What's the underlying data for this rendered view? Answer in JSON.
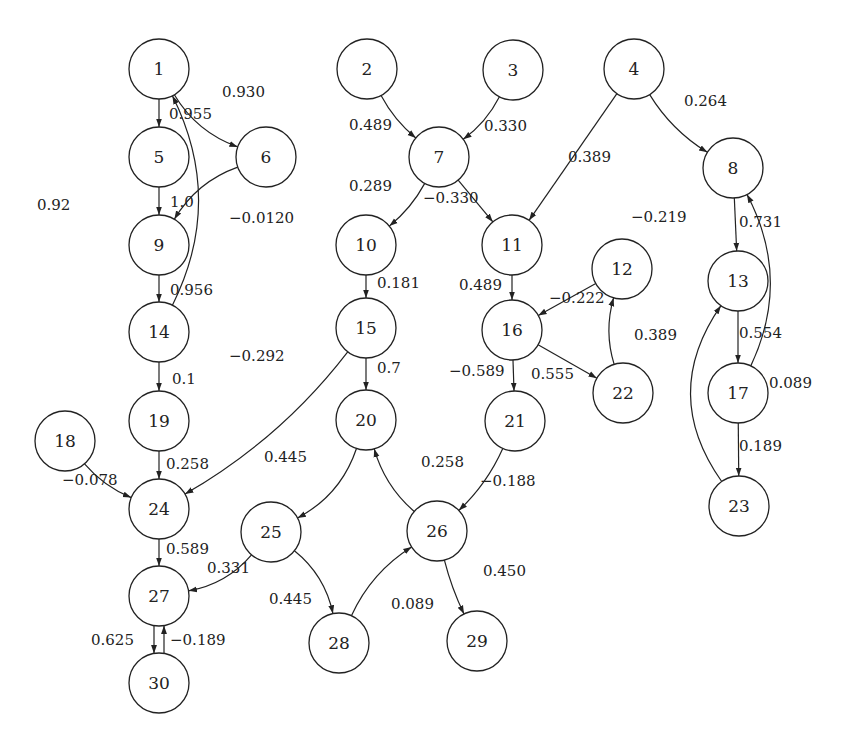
{
  "diagram": {
    "type": "directed-weighted-graph",
    "nodes": [
      "1",
      "2",
      "3",
      "4",
      "5",
      "6",
      "7",
      "8",
      "9",
      "10",
      "11",
      "12",
      "13",
      "14",
      "15",
      "16",
      "17",
      "18",
      "19",
      "20",
      "21",
      "22",
      "23",
      "24",
      "25",
      "26",
      "27",
      "28",
      "29",
      "30"
    ],
    "edges": [
      {
        "from": "1",
        "to": "5",
        "weight": "0.955"
      },
      {
        "from": "1",
        "to": "6",
        "weight": "0.930"
      },
      {
        "from": "5",
        "to": "9",
        "weight": "1.0"
      },
      {
        "from": "6",
        "to": "9",
        "weight": "−0.0120"
      },
      {
        "from": "9",
        "to": "14",
        "weight": "0.956"
      },
      {
        "from": "14",
        "to": "1",
        "weight": "0.92"
      },
      {
        "from": "14",
        "to": "19",
        "weight": "0.1"
      },
      {
        "from": "19",
        "to": "24",
        "weight": "0.258"
      },
      {
        "from": "18",
        "to": "24",
        "weight": "−0.078"
      },
      {
        "from": "15",
        "to": "24",
        "weight": "−0.292"
      },
      {
        "from": "24",
        "to": "27",
        "weight": "0.589"
      },
      {
        "from": "25",
        "to": "27",
        "weight": "0.331"
      },
      {
        "from": "27",
        "to": "30",
        "weight": "0.625"
      },
      {
        "from": "30",
        "to": "27",
        "weight": "−0.189"
      },
      {
        "from": "2",
        "to": "7",
        "weight": "0.489"
      },
      {
        "from": "3",
        "to": "7",
        "weight": "0.330"
      },
      {
        "from": "7",
        "to": "10",
        "weight": "0.289"
      },
      {
        "from": "7",
        "to": "11",
        "weight": "−0.330"
      },
      {
        "from": "4",
        "to": "11",
        "weight": "0.389"
      },
      {
        "from": "4",
        "to": "8",
        "weight": "0.264"
      },
      {
        "from": "10",
        "to": "15",
        "weight": "0.181"
      },
      {
        "from": "15",
        "to": "20",
        "weight": "0.7"
      },
      {
        "from": "20",
        "to": "25",
        "weight": "0.445"
      },
      {
        "from": "26",
        "to": "20",
        "weight": "0.258"
      },
      {
        "from": "25",
        "to": "28",
        "weight": "0.445"
      },
      {
        "from": "28",
        "to": "26",
        "weight": "0.089"
      },
      {
        "from": "26",
        "to": "29",
        "weight": "0.450"
      },
      {
        "from": "21",
        "to": "26",
        "weight": "−0.188"
      },
      {
        "from": "11",
        "to": "16",
        "weight": "0.489"
      },
      {
        "from": "12",
        "to": "16",
        "weight": "−0.222"
      },
      {
        "from": "16",
        "to": "21",
        "weight": "−0.589"
      },
      {
        "from": "16",
        "to": "22",
        "weight": "0.555"
      },
      {
        "from": "22",
        "to": "12",
        "weight": "0.389"
      },
      {
        "from": "8",
        "to": "13",
        "weight": "0.731"
      },
      {
        "from": "17",
        "to": "8",
        "weight": "−0.219"
      },
      {
        "from": "13",
        "to": "17",
        "weight": "0.554"
      },
      {
        "from": "17",
        "to": "23",
        "weight": "0.189"
      },
      {
        "from": "23",
        "to": "13",
        "weight": "0.089"
      }
    ]
  }
}
